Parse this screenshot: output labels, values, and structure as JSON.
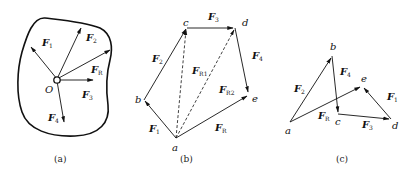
{
  "figure": {
    "panels": [
      {
        "id": "a",
        "caption": "(a)",
        "origin_label": "O",
        "forces": [
          {
            "name": "F",
            "sub": "1"
          },
          {
            "name": "F",
            "sub": "2"
          },
          {
            "name": "F",
            "sub": "R"
          },
          {
            "name": "F",
            "sub": "3"
          },
          {
            "name": "F",
            "sub": "4"
          }
        ]
      },
      {
        "id": "b",
        "caption": "(b)",
        "points": [
          "a",
          "b",
          "c",
          "d",
          "e"
        ],
        "forces": [
          {
            "name": "F",
            "sub": "1"
          },
          {
            "name": "F",
            "sub": "2"
          },
          {
            "name": "F",
            "sub": "3"
          },
          {
            "name": "F",
            "sub": "4"
          },
          {
            "name": "F",
            "sub": "R1"
          },
          {
            "name": "F",
            "sub": "R2"
          },
          {
            "name": "F",
            "sub": "R"
          }
        ]
      },
      {
        "id": "c",
        "caption": "(c)",
        "points": [
          "a",
          "b",
          "c",
          "d",
          "e"
        ],
        "forces": [
          {
            "name": "F",
            "sub": "2"
          },
          {
            "name": "F",
            "sub": "4"
          },
          {
            "name": "F",
            "sub": "R"
          },
          {
            "name": "F",
            "sub": "3"
          },
          {
            "name": "F",
            "sub": "1"
          }
        ]
      }
    ],
    "colors": {
      "ink": "#111111",
      "background": "#ffffff"
    }
  }
}
